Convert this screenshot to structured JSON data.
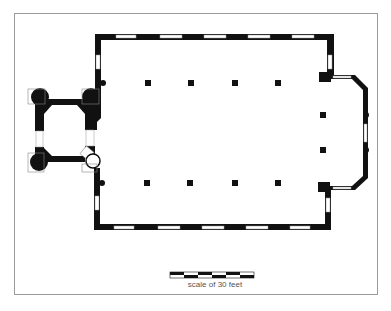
{
  "figure": {
    "type": "architectural floor plan",
    "clipped_caption": "",
    "scale_label": "scale of 30 feet",
    "scale_segments": 6,
    "colors": {
      "wall": "#111111",
      "frame": "#9a9a9a",
      "window": "#ffffff",
      "background": "#ffffff"
    },
    "elements": {
      "tower": "west tower with four round corner piers and stair turret",
      "nave": "rectangular nave with 5 windows per long side",
      "columns": "two rows of 4 columns plus 2 engaged columns",
      "chancel": "east chancel with chamfered corners and 2 columns"
    }
  }
}
